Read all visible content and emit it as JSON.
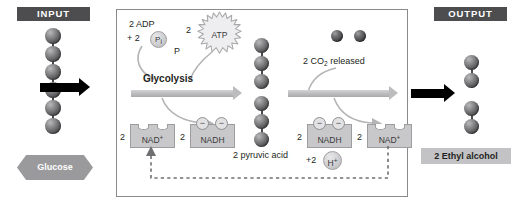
{
  "diagram": {
    "input_banner": "INPUT",
    "output_banner": "OUTPUT",
    "glucose_label": "Glucose",
    "ethyl_alcohol_label": "2 Ethyl alcohol",
    "pyruvic_acid_label": "2 pyruvic acid",
    "glycolysis_label": "Glycolysis",
    "adp_line1": "2 ADP",
    "adp_line2_prefix": "+ 2",
    "pi_label": "P",
    "pi_sub": "i",
    "p_marker": "P",
    "atp_count": "2",
    "atp_label": "ATP",
    "co2_prefix": "2 CO",
    "co2_sub": "2",
    "co2_suffix": " released",
    "nad_plus_left_count": "2",
    "nad_plus_left_label": "NAD",
    "nad_plus_left_sup": "+",
    "nadh_left_count": "2",
    "nadh_left_label": "NADH",
    "nadh_right_count": "2",
    "nadh_right_label": "NADH",
    "nad_plus_right_count": "2",
    "nad_plus_right_label": "NAD",
    "nad_plus_right_sup": "+",
    "h_plus_prefix": "+2",
    "h_plus_label": "H",
    "h_plus_sup": "+",
    "electron_glyph": "−",
    "colors": {
      "banner_bg": "#4d4d4f",
      "banner_text": "#ffffff",
      "panel_border": "#8a8a8d",
      "gray_arrow": "#bdbdbf",
      "black_arrow": "#000000",
      "nad_box": "#c8c8ca",
      "hex_fill": "#9a9a9c",
      "plate_fill": "#c3c3c5",
      "text": "#231f20"
    },
    "molecules": {
      "glucose_carbons": 6,
      "pyruvate_carbons": 3,
      "pyruvate_molecules": 2,
      "ethanol_carbons": 2,
      "ethanol_molecules": 2,
      "co2_molecules": 2
    }
  }
}
